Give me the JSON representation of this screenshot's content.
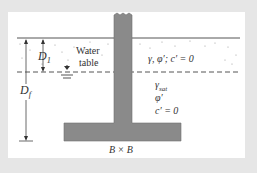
{
  "diagram": {
    "labels": {
      "d1": "D",
      "d1_sub": "1",
      "df": "D",
      "df_sub": "f",
      "water_table_1": "Water",
      "water_table_2": "table",
      "upper_soil": "γ, φ′; c′ = 0",
      "gamma_sat": "γ",
      "gamma_sat_sub": "sat",
      "phi": "φ′",
      "cohesion": "c′ = 0",
      "footing_size": "B × B"
    },
    "colors": {
      "background": "#e6e6e6",
      "panel": "#ffffff",
      "footing": "#8a8a8a",
      "lines": "#555555"
    }
  }
}
